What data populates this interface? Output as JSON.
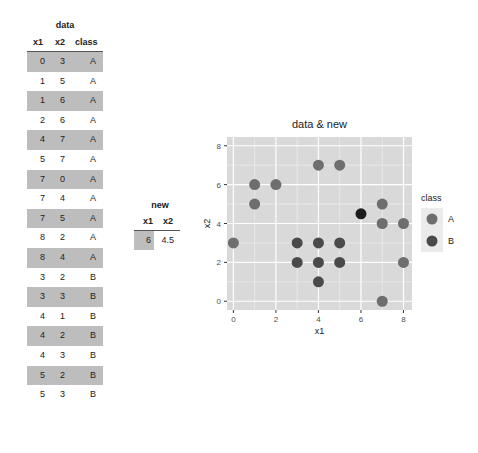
{
  "data_table": {
    "title": "data",
    "columns": [
      "x1",
      "x2",
      "class"
    ],
    "rows": [
      [
        "0",
        "3",
        "A"
      ],
      [
        "1",
        "5",
        "A"
      ],
      [
        "1",
        "6",
        "A"
      ],
      [
        "2",
        "6",
        "A"
      ],
      [
        "4",
        "7",
        "A"
      ],
      [
        "5",
        "7",
        "A"
      ],
      [
        "7",
        "0",
        "A"
      ],
      [
        "7",
        "4",
        "A"
      ],
      [
        "7",
        "5",
        "A"
      ],
      [
        "8",
        "2",
        "A"
      ],
      [
        "8",
        "4",
        "A"
      ],
      [
        "3",
        "2",
        "B"
      ],
      [
        "3",
        "3",
        "B"
      ],
      [
        "4",
        "1",
        "B"
      ],
      [
        "4",
        "2",
        "B"
      ],
      [
        "4",
        "3",
        "B"
      ],
      [
        "5",
        "2",
        "B"
      ],
      [
        "5",
        "3",
        "B"
      ]
    ]
  },
  "new_table": {
    "title": "new",
    "columns": [
      "x1",
      "x2"
    ],
    "rows": [
      [
        "6",
        "4.5"
      ]
    ]
  },
  "colors": {
    "panel_bg": "#d9d9d9",
    "grid": "#f2f2f2",
    "class_A": "#6e6e6e",
    "class_B": "#4a4a4a",
    "new_point": "#1c1c1c",
    "row_shade": "#bdbdbd"
  },
  "chart_data": {
    "type": "scatter",
    "title": "data & new",
    "xlabel": "x1",
    "ylabel": "x2",
    "xlim": [
      -0.3,
      8.4
    ],
    "ylim": [
      -0.45,
      8.45
    ],
    "xticks": [
      0,
      2,
      4,
      6,
      8
    ],
    "yticks": [
      0,
      2,
      4,
      6,
      8
    ],
    "grid": true,
    "legend": {
      "title": "class",
      "position": "right",
      "entries": [
        "A",
        "B"
      ]
    },
    "series": [
      {
        "name": "A",
        "x": [
          0,
          1,
          1,
          2,
          4,
          5,
          7,
          7,
          7,
          8,
          8
        ],
        "y": [
          3,
          5,
          6,
          6,
          7,
          7,
          0,
          4,
          5,
          2,
          4
        ]
      },
      {
        "name": "B",
        "x": [
          3,
          3,
          4,
          4,
          4,
          5,
          5
        ],
        "y": [
          2,
          3,
          1,
          2,
          3,
          2,
          3
        ]
      },
      {
        "name": "new",
        "x": [
          6
        ],
        "y": [
          4.5
        ]
      }
    ]
  }
}
